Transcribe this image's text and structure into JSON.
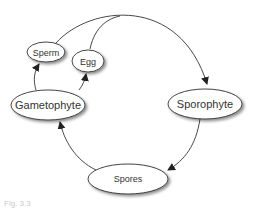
{
  "diagram": {
    "type": "cycle",
    "nodes": [
      {
        "id": "sperm",
        "label": "Sperm"
      },
      {
        "id": "egg",
        "label": "Egg"
      },
      {
        "id": "gametophyte",
        "label": "Gametophyte"
      },
      {
        "id": "sporophyte",
        "label": "Sporophyte"
      },
      {
        "id": "spores",
        "label": "Spores"
      }
    ],
    "edges": [
      {
        "from": "gametophyte",
        "to": "sperm"
      },
      {
        "from": "gametophyte",
        "to": "egg"
      },
      {
        "from": "sperm",
        "to": "sporophyte"
      },
      {
        "from": "egg",
        "to": "sporophyte"
      },
      {
        "from": "sporophyte",
        "to": "spores"
      },
      {
        "from": "spores",
        "to": "gametophyte"
      }
    ]
  },
  "caption": "Fig. 3.3",
  "colors": {
    "stroke": "#333333",
    "fill": "#ffffff",
    "shadow": "#bbbbbb"
  }
}
